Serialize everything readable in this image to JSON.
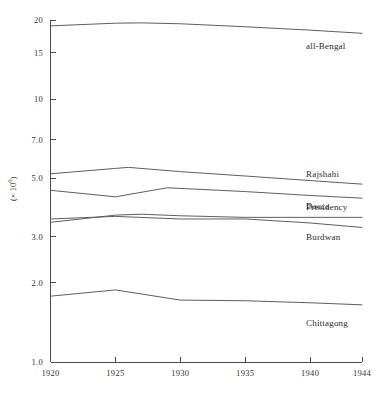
{
  "chart_data": {
    "type": "line",
    "title": "",
    "xlabel": "",
    "ylabel": "(× 10⁶)",
    "yscale": "log",
    "ylim": [
      1.0,
      20.0
    ],
    "xlim": [
      1920,
      1944
    ],
    "grid": false,
    "legend_position": "right-inline",
    "y_ticks": [
      "1.0",
      "2.0",
      "3.0",
      "5.0",
      "7.0",
      "10",
      "15",
      "20"
    ],
    "y_tick_values": [
      1.0,
      2.0,
      3.0,
      5.0,
      7.0,
      10,
      15,
      20
    ],
    "x_ticks": [
      "1920",
      "1925",
      "1930",
      "1935",
      "1940",
      "1944"
    ],
    "x_tick_values": [
      1920,
      1925,
      1930,
      1935,
      1940,
      1944
    ],
    "series": [
      {
        "name": "all-Bengal",
        "x": [
          1920,
          1925,
          1927,
          1930,
          1935,
          1940,
          1944
        ],
        "values": [
          19.0,
          19.45,
          19.5,
          19.35,
          18.85,
          18.3,
          17.8
        ]
      },
      {
        "name": "Rajshahi",
        "x": [
          1920,
          1925,
          1926,
          1930,
          1935,
          1940,
          1944
        ],
        "values": [
          5.2,
          5.45,
          5.5,
          5.3,
          5.1,
          4.9,
          4.75
        ]
      },
      {
        "name": "Dacca",
        "x": [
          1920,
          1925,
          1929,
          1935,
          1940,
          1944
        ],
        "values": [
          4.5,
          4.25,
          4.6,
          4.45,
          4.3,
          4.2
        ]
      },
      {
        "name": "Presidency",
        "x": [
          1920,
          1925,
          1927,
          1930,
          1935,
          1940,
          1944
        ],
        "values": [
          3.4,
          3.62,
          3.65,
          3.6,
          3.55,
          3.55,
          3.55
        ]
      },
      {
        "name": "Burdwan",
        "x": [
          1920,
          1925,
          1930,
          1935,
          1940,
          1944
        ],
        "values": [
          3.5,
          3.58,
          3.5,
          3.5,
          3.38,
          3.25
        ]
      },
      {
        "name": "Chittagong",
        "x": [
          1920,
          1925,
          1930,
          1935,
          1940,
          1944
        ],
        "values": [
          1.78,
          1.88,
          1.72,
          1.71,
          1.68,
          1.65
        ]
      }
    ],
    "series_labels": [
      {
        "name": "all-Bengal",
        "text": "all-Bengal"
      },
      {
        "name": "Rajshahi",
        "text": "Rajshahi"
      },
      {
        "name": "Dacca",
        "text": "Dacca"
      },
      {
        "name": "Presidency",
        "text": "Presidency"
      },
      {
        "name": "Burdwan",
        "text": "Burdwan"
      },
      {
        "name": "Chittagong",
        "text": "Chittagong"
      }
    ],
    "colors": {
      "line": "#5e5e5e",
      "axis": "#4a4a4a",
      "text": "#2b2b2b"
    }
  }
}
